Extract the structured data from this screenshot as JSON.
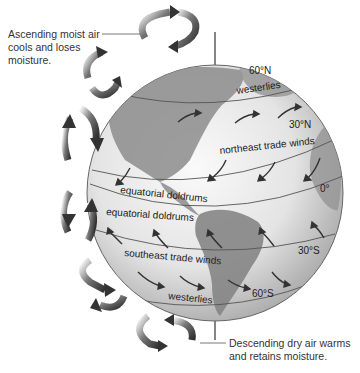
{
  "diagram": {
    "annotations": {
      "ascending": {
        "lines": [
          "Ascending moist air",
          "cools and loses",
          "moisture."
        ]
      },
      "descending": {
        "lines": [
          "Descending dry air warms",
          "and retains moisture."
        ]
      }
    },
    "latitudes": {
      "n60": "60°N",
      "n30": "30°N",
      "eq": "0°",
      "s30": "30°S",
      "s60": "60°S"
    },
    "wind_belts": {
      "westerlies_north": "westerlies",
      "ne_trade": "northeast trade winds",
      "doldrums_north": "equatorial doldrums",
      "doldrums_south": "equatorial doldrums",
      "se_trade": "southeast trade winds",
      "westerlies_south": "westerlies"
    },
    "colors": {
      "globe_light": "#f2f2f2",
      "globe_dark": "#9a9a9a",
      "land": "#8a8a8a",
      "arrow": "#444444",
      "text": "#333333"
    }
  }
}
